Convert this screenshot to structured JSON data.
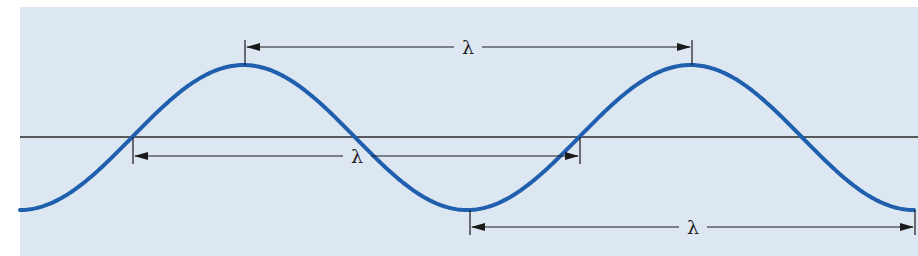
{
  "diagram": {
    "colors": {
      "page_background": "#ffffff",
      "panel_background": "#dce7f2",
      "wave": "#1f5fae",
      "axis": "#2b2b2b",
      "dimension_line": "#1a1a1a",
      "label": "#222222"
    },
    "panel": {
      "x": 20,
      "y": 7,
      "width": 898,
      "height": 249
    },
    "axis": {
      "y": 137,
      "x_start": 20,
      "x_end": 918
    },
    "wave": {
      "x_start": 20,
      "x_end": 915,
      "trough_y": 210,
      "peak_y": 65,
      "period_px": 447,
      "first_trough_x": 20,
      "peaks_x": [
        245,
        692
      ],
      "troughs_x": [
        20,
        470,
        915
      ],
      "zero_crossings_x": [
        133,
        357,
        580,
        804
      ]
    },
    "dimensions": [
      {
        "name": "crest-to-crest",
        "label": "λ",
        "y": 47,
        "x1": 245,
        "x2": 692,
        "tick_top": 40,
        "tick_bottom": 65,
        "label_x": 468
      },
      {
        "name": "node-to-node",
        "label": "λ",
        "y": 156,
        "x1": 133,
        "x2": 580,
        "tick_top": 137,
        "tick_bottom": 164,
        "label_x": 357
      },
      {
        "name": "trough-to-trough",
        "label": "λ",
        "y": 227,
        "x1": 470,
        "x2": 915,
        "tick_top": 210,
        "tick_bottom": 235,
        "label_x": 693
      }
    ]
  }
}
